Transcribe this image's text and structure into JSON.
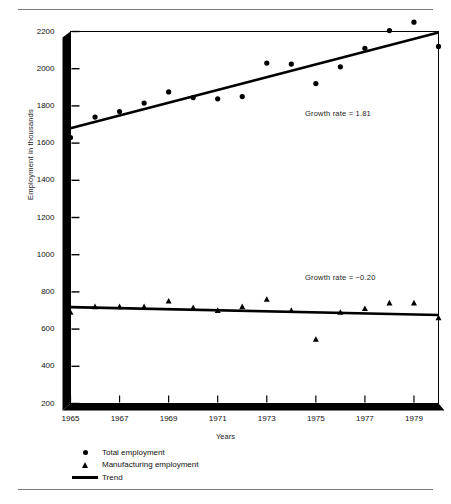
{
  "figure": {
    "rule_color": "#7a7a7a"
  },
  "axes": {
    "ylabel": "Employment in thousands",
    "xlabel": "Years",
    "yticks": [
      "200",
      "400",
      "600",
      "800",
      "1000",
      "1200",
      "1400",
      "1600",
      "1800",
      "2000",
      "2200"
    ],
    "xticks": [
      "1965",
      "1967",
      "1969",
      "1971",
      "1973",
      "1975",
      "1977",
      "1979"
    ]
  },
  "annotations": {
    "upper": "Growth rate  =  1.81",
    "lower": "Growth rate  =  −0.20"
  },
  "legend": {
    "items": [
      {
        "symbol": "dot-marker",
        "label": "Total employment"
      },
      {
        "symbol": "triangle-marker",
        "label": "Manufacturing employment"
      },
      {
        "symbol": "line-marker",
        "label": "Trend"
      }
    ]
  },
  "chart_data": {
    "type": "scatter",
    "title": "",
    "xlabel": "Years",
    "ylabel": "Employment in thousands",
    "xlim": [
      1965,
      1980
    ],
    "ylim": [
      200,
      2200
    ],
    "ytick_values": [
      200,
      400,
      600,
      800,
      1000,
      1200,
      1400,
      1600,
      1800,
      2000,
      2200
    ],
    "xtick_values": [
      1965,
      1967,
      1969,
      1971,
      1973,
      1975,
      1977,
      1979
    ],
    "grid": false,
    "legend_position": "below-axes-left",
    "x": [
      1965,
      1966,
      1967,
      1968,
      1969,
      1970,
      1971,
      1972,
      1973,
      1974,
      1975,
      1976,
      1977,
      1978,
      1979,
      1980
    ],
    "series": [
      {
        "name": "Total employment",
        "marker": "circle",
        "values": [
          1630,
          1740,
          1770,
          1815,
          1875,
          1845,
          1838,
          1850,
          2030,
          2025,
          1920,
          2010,
          2110,
          2205,
          2250,
          2120
        ]
      },
      {
        "name": "Manufacturing employment",
        "marker": "triangle",
        "values": [
          690,
          720,
          720,
          720,
          750,
          715,
          700,
          720,
          760,
          700,
          545,
          690,
          710,
          740,
          740,
          660
        ]
      }
    ],
    "trends": [
      {
        "name": "Total employment trend",
        "growth_rate": 1.81,
        "x_start": 1965,
        "y_start": 1680,
        "x_end": 1980,
        "y_end": 2195
      },
      {
        "name": "Manufacturing employment trend",
        "growth_rate": -0.2,
        "x_start": 1965,
        "y_start": 718,
        "x_end": 1980,
        "y_end": 676
      }
    ]
  }
}
